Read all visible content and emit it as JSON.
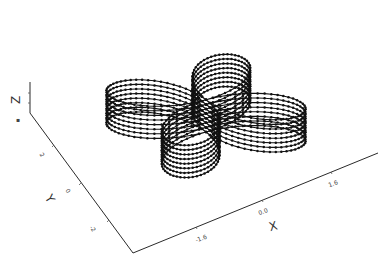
{
  "chart_data": {
    "type": "line",
    "subtype": "3d-stacked-curves",
    "title": "",
    "xlabel": "X",
    "ylabel": "Y",
    "zlabel": "Z",
    "x_ticks": [
      "-1.6",
      "0.0",
      "1.6"
    ],
    "y_ticks": [
      "2",
      "0",
      "-2"
    ],
    "z_ticks": [],
    "xlim": [
      -2.4,
      2.4
    ],
    "ylim": [
      -2.4,
      2.4
    ],
    "series": [
      {
        "name": "layer-1",
        "z": 0
      },
      {
        "name": "layer-2",
        "z": 1
      },
      {
        "name": "layer-3",
        "z": 2
      },
      {
        "name": "layer-4",
        "z": 3
      },
      {
        "name": "layer-5",
        "z": 4
      },
      {
        "name": "layer-6",
        "z": 5
      },
      {
        "name": "layer-7",
        "z": 6
      },
      {
        "name": "layer-8",
        "z": 7
      }
    ],
    "curve": {
      "equation": "r = 2*cos(2*theta)",
      "samples": 160
    },
    "marker": "dot",
    "grid": false,
    "legend": null
  },
  "axes": {
    "x_label": "X",
    "y_label": "Y",
    "z_label": "Z",
    "x_ticks": [
      "-1.6",
      "0.0",
      "1.6"
    ],
    "y_ticks": [
      "2",
      "0",
      "-2"
    ]
  }
}
